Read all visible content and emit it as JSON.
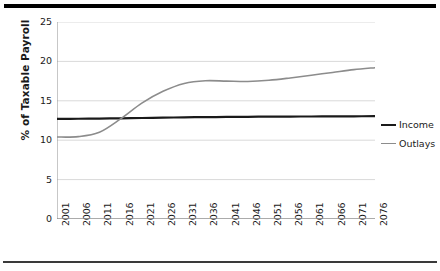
{
  "figure": {
    "top_rule_color": "#000000",
    "bottom_rule_color": "#3a3a3a"
  },
  "chart_data": {
    "type": "line",
    "title": "",
    "subtitle": "",
    "xlabel": "",
    "ylabel": "% of Taxable Payroll",
    "ylim": [
      0,
      25
    ],
    "yticks": [
      0,
      5,
      10,
      15,
      20,
      25
    ],
    "ytick_labels": [
      "0",
      "5",
      "10",
      "15",
      "20",
      "25"
    ],
    "grid": "horizontal",
    "legend_position": "right",
    "x": [
      2001,
      2006,
      2011,
      2016,
      2021,
      2026,
      2031,
      2036,
      2041,
      2046,
      2051,
      2056,
      2061,
      2066,
      2071,
      2076
    ],
    "categories": [
      "2001",
      "2006",
      "2011",
      "2016",
      "2021",
      "2026",
      "2031",
      "2036",
      "2041",
      "2046",
      "2051",
      "2056",
      "2061",
      "2066",
      "2071",
      "2076"
    ],
    "series": [
      {
        "name": "Income",
        "color": "#1a1a1a",
        "values": [
          12.7,
          12.72,
          12.75,
          12.78,
          12.82,
          12.86,
          12.9,
          12.93,
          12.95,
          12.97,
          12.99,
          13.0,
          13.01,
          13.02,
          13.03,
          13.05
        ]
      },
      {
        "name": "Outlays",
        "color": "#8c8c8c",
        "values": [
          10.4,
          10.45,
          11.0,
          12.7,
          14.7,
          16.2,
          17.2,
          17.55,
          17.5,
          17.45,
          17.6,
          17.9,
          18.25,
          18.6,
          18.95,
          19.2
        ]
      }
    ],
    "annotations": []
  },
  "legend": {
    "items": [
      {
        "label": "Income",
        "color": "#1a1a1a",
        "width": "2.2px"
      },
      {
        "label": "Outlays",
        "color": "#8c8c8c",
        "width": "1.6px"
      }
    ]
  }
}
